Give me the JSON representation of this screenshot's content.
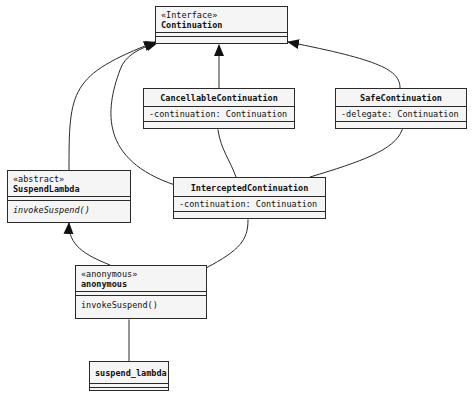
{
  "diagram": {
    "type": "UML class diagram",
    "classes": [
      {
        "id": "continuation",
        "stereotype": "«Interface»",
        "name": "Continuation",
        "attributes": [],
        "methods": []
      },
      {
        "id": "cancellable",
        "stereotype": "",
        "name": "CancellableContinuation",
        "attributes": [
          "-continuation: Continuation"
        ],
        "methods": []
      },
      {
        "id": "safe",
        "stereotype": "",
        "name": "SafeContinuation",
        "attributes": [
          "-delegate: Continuation"
        ],
        "methods": []
      },
      {
        "id": "suspendlambda",
        "stereotype": "«abstract»",
        "name": "SuspendLambda",
        "attributes": [],
        "methods": [
          "invokeSuspend()"
        ]
      },
      {
        "id": "intercepted",
        "stereotype": "",
        "name": "InterceptedContinuation",
        "attributes": [
          "-continuation: Continuation"
        ],
        "methods": []
      },
      {
        "id": "anonymous",
        "stereotype": "«anonymous»",
        "name": "anonymous",
        "attributes": [],
        "methods": [
          "invokeSuspend()"
        ]
      },
      {
        "id": "suspend_lambda",
        "stereotype": "",
        "name": "suspend_lambda",
        "attributes": [],
        "methods": []
      }
    ],
    "relations": [
      {
        "from": "cancellable",
        "to": "continuation",
        "kind": "inheritance"
      },
      {
        "from": "safe",
        "to": "continuation",
        "kind": "inheritance"
      },
      {
        "from": "suspendlambda",
        "to": "continuation",
        "kind": "inheritance"
      },
      {
        "from": "intercepted",
        "to": "continuation",
        "kind": "inheritance"
      },
      {
        "from": "anonymous",
        "to": "suspendlambda",
        "kind": "inheritance"
      },
      {
        "from": "intercepted",
        "to": "cancellable",
        "kind": "composition"
      },
      {
        "from": "intercepted",
        "to": "safe",
        "kind": "composition"
      },
      {
        "from": "anonymous",
        "to": "intercepted",
        "kind": "composition"
      },
      {
        "from": "suspend_lambda",
        "to": "anonymous",
        "kind": "composition"
      }
    ],
    "colors": {
      "line": "#2a2a2a",
      "box_fill": "#f5f5f5"
    }
  }
}
